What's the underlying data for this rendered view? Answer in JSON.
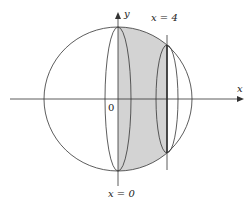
{
  "diagram": {
    "labels": {
      "y_axis": "y",
      "x_axis": "x",
      "origin": "0",
      "x4": "x = 4",
      "x0": "x = 0"
    },
    "colors": {
      "stroke": "#333333",
      "shade": "#d3d3d3",
      "background": "#ffffff"
    }
  }
}
